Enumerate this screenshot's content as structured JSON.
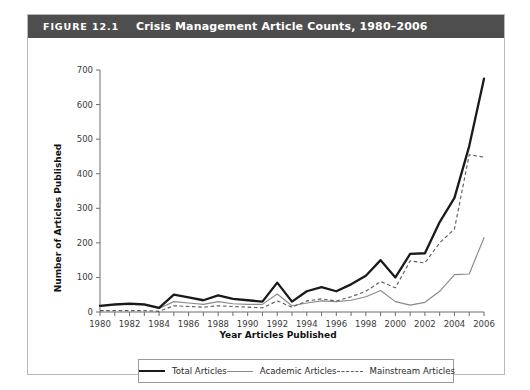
{
  "figure": {
    "number": "FIGURE 12.1",
    "title": "Crisis Management Article Counts, 1980–2006"
  },
  "legend": {
    "items": [
      {
        "label": "Total Articles",
        "style": "solid-thick-black",
        "color": "#1a1a1a"
      },
      {
        "label": "Academic Articles",
        "style": "solid-thin-gray",
        "color": "#8a8a8a"
      },
      {
        "label": "Mainstream Articles",
        "style": "dashed-gray",
        "color": "#5f5f5f"
      }
    ]
  },
  "chart_data": {
    "type": "line",
    "title": "Crisis Management Article Counts, 1980–2006",
    "xlabel": "Year Articles Published",
    "ylabel": "Number of Articles Published",
    "xlim": [
      1980,
      2006
    ],
    "ylim": [
      0,
      700
    ],
    "ytick_values": [
      0,
      100,
      200,
      300,
      400,
      500,
      600,
      700
    ],
    "xtick_values": [
      1980,
      1981,
      1982,
      1983,
      1984,
      1985,
      1986,
      1987,
      1988,
      1989,
      1990,
      1991,
      1992,
      1993,
      1994,
      1995,
      1996,
      1997,
      1998,
      1999,
      2000,
      2001,
      2002,
      2003,
      2004,
      2005,
      2006
    ],
    "xtick_labels": [
      "1980",
      "",
      "1982",
      "",
      "1984",
      "",
      "1986",
      "",
      "1988",
      "",
      "1990",
      "",
      "1992",
      "",
      "1994",
      "",
      "1996",
      "",
      "1998",
      "",
      "2000",
      "",
      "2002",
      "",
      "2004",
      "",
      "2006"
    ],
    "grid": false,
    "legend_position": "below-plot",
    "x": [
      1980,
      1981,
      1982,
      1983,
      1984,
      1985,
      1986,
      1987,
      1988,
      1989,
      1990,
      1991,
      1992,
      1993,
      1994,
      1995,
      1996,
      1997,
      1998,
      1999,
      2000,
      2001,
      2002,
      2003,
      2004,
      2005,
      2006
    ],
    "series": [
      {
        "name": "Total Articles",
        "color": "#1a1a1a",
        "values": [
          18,
          22,
          24,
          22,
          12,
          50,
          42,
          34,
          48,
          38,
          34,
          30,
          85,
          30,
          60,
          72,
          60,
          80,
          105,
          150,
          100,
          168,
          170,
          260,
          330,
          480,
          675
        ]
      },
      {
        "name": "Academic Articles",
        "color": "#8a8a8a",
        "values": [
          16,
          20,
          22,
          20,
          10,
          30,
          26,
          22,
          30,
          24,
          22,
          22,
          52,
          18,
          26,
          32,
          30,
          34,
          44,
          62,
          30,
          20,
          28,
          60,
          108,
          110,
          215
        ]
      },
      {
        "name": "Mainstream Articles",
        "color": "#5f5f5f",
        "values": [
          4,
          4,
          4,
          4,
          2,
          18,
          16,
          14,
          18,
          16,
          14,
          12,
          32,
          14,
          32,
          38,
          32,
          44,
          60,
          88,
          70,
          148,
          142,
          200,
          240,
          455,
          448
        ]
      }
    ]
  }
}
